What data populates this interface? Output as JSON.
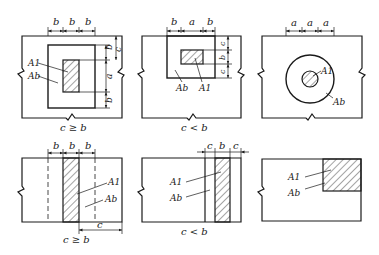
{
  "diagram": {
    "panels": [
      {
        "id": "p1",
        "dims": [
          "b",
          "b",
          "b"
        ],
        "side_dims": [
          "c",
          "b",
          "a",
          "b"
        ],
        "labels": [
          "A1",
          "Ab"
        ],
        "caption": "c ≥ b"
      },
      {
        "id": "p2",
        "dims": [
          "b",
          "a",
          "b"
        ],
        "side_dims": [
          "c",
          "b",
          "c"
        ],
        "labels": [
          "Ab",
          "A1"
        ],
        "caption": "c < b"
      },
      {
        "id": "p3",
        "dims": [
          "a",
          "a",
          "a"
        ],
        "labels": [
          "A1",
          "Ab"
        ],
        "caption": ""
      },
      {
        "id": "p4",
        "dims": [
          "b",
          "b",
          "b"
        ],
        "bottom_dim": "c",
        "labels": [
          "A1",
          "Ab"
        ],
        "caption": "c ≥ b"
      },
      {
        "id": "p5",
        "dims": [
          "c",
          "b",
          "c"
        ],
        "labels": [
          "A1",
          "Ab"
        ],
        "caption": "c < b"
      },
      {
        "id": "p6",
        "labels": [
          "A1",
          "Ab"
        ],
        "caption": ""
      }
    ],
    "colors": {
      "line": "#1a1a1a",
      "background": "#ffffff"
    }
  }
}
